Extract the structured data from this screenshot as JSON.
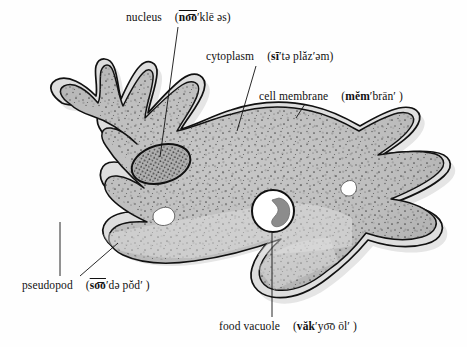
{
  "figure": {
    "background_color": "#fefefe",
    "ink_color": "#111111",
    "cytoplasm_fill": "#b9b9b9",
    "ectoplasm_fill": "#d8d8d8",
    "nucleus_fill": "#9a9a9a",
    "vacuole_fill": "#ffffff",
    "food_particle_fill": "#8a8a8a"
  },
  "labels": {
    "nucleus": {
      "term": "nucleus",
      "pron_open": "(",
      "pron_bold": "no͞o",
      "pron_rest": "′klē əs",
      "pron_close": ")",
      "pron_plain": "(no͞o′klē əs)"
    },
    "cytoplasm": {
      "term": "cytoplasm",
      "pron_open": "(",
      "pron_bold": "sī",
      "pron_rest": "′tə plăz′əm",
      "pron_close": ")",
      "pron_plain": "(sī′tə plăz′əm)"
    },
    "cell_membrane": {
      "term": "cell membrane",
      "pron_open": "(",
      "pron_bold": "mĕm",
      "pron_rest": "′brān′ ",
      "pron_close": ")",
      "pron_plain": "(mĕm′brān′ )"
    },
    "pseudopod": {
      "term": "pseudopod",
      "pron_open": "(",
      "pron_bold": "so͞o",
      "pron_rest": "′də pŏd′ ",
      "pron_close": ")",
      "pron_plain": "(so͞o′də pŏd′ )"
    },
    "food_vacuole": {
      "term": "food vacuole",
      "pron_open": "(",
      "pron_bold": "văk",
      "pron_rest": "′yo͞o ōl′ ",
      "pron_close": ")",
      "pron_plain": "(văk′yo͞o ōl′ )"
    }
  },
  "structures": [
    {
      "name": "nucleus",
      "kind": "organelle",
      "description": "dark stippled tilted ellipse"
    },
    {
      "name": "cytoplasm",
      "kind": "region",
      "description": "gray stippled cell interior"
    },
    {
      "name": "cell-membrane",
      "kind": "boundary",
      "description": "double outline around cell"
    },
    {
      "name": "pseudopod",
      "kind": "projection",
      "description": "finger-like extensions of the cell"
    },
    {
      "name": "food-vacuole",
      "kind": "organelle",
      "description": "white circle containing a dark food particle"
    },
    {
      "name": "contractile-vacuole-left",
      "kind": "organelle",
      "description": "small white irregular vacuole"
    },
    {
      "name": "contractile-vacuole-right",
      "kind": "organelle",
      "description": "small white irregular vacuole"
    }
  ]
}
